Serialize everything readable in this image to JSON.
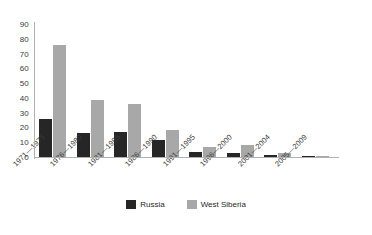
{
  "chart_data": {
    "type": "bar",
    "title": "",
    "subtitle": "",
    "xlabel": "",
    "ylabel": "",
    "ylim": [
      0,
      90
    ],
    "ytick_step": 10,
    "yticks": [
      90,
      80,
      70,
      60,
      50,
      40,
      30,
      20,
      10,
      0
    ],
    "grid": false,
    "legend_position": "bottom-center",
    "categories": [
      "1971—1975",
      "1976—1980",
      "1981—1985",
      "1986—1990",
      "1991—1995",
      "1996—2000",
      "2001—2004",
      "2005—2009"
    ],
    "series": [
      {
        "name": "Russia",
        "color": "#262626",
        "values": [
          26,
          16,
          17,
          11.5,
          3.5,
          3,
          1.5,
          1
        ]
      },
      {
        "name": "West Siberia",
        "color": "#a8a8a8",
        "values": [
          76,
          38.5,
          36,
          18,
          7,
          8,
          2.5,
          0.8
        ]
      }
    ]
  },
  "legend": {
    "items": [
      {
        "label": "Russia",
        "swatch": "russia"
      },
      {
        "label": "West Siberia",
        "swatch": "siberia"
      }
    ]
  },
  "colors": {
    "russia": "#262626",
    "west_siberia": "#a8a8a8",
    "axis": "#b0b0b0",
    "text": "#3a3a3a",
    "background": "#ffffff"
  }
}
